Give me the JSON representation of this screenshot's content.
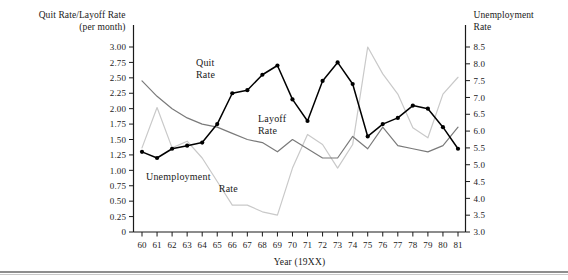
{
  "chart_data": {
    "type": "line",
    "title": "",
    "xlabel": "Year (19XX)",
    "ylabel_left": "Quit Rate/Layoff Rate\n(per month)",
    "ylabel_right": "Unemployment\nRate",
    "x": [
      60,
      61,
      62,
      63,
      64,
      65,
      66,
      67,
      68,
      69,
      70,
      71,
      72,
      73,
      74,
      75,
      76,
      77,
      78,
      79,
      80,
      81
    ],
    "xtick_labels": [
      "60",
      "61",
      "62",
      "63",
      "64",
      "65",
      "66",
      "67",
      "68",
      "69",
      "70",
      "71",
      "72",
      "73",
      "74",
      "75",
      "76",
      "77",
      "78",
      "79",
      "80",
      "81"
    ],
    "left_axis": {
      "ylim": [
        0,
        3.0
      ],
      "ticks": [
        0,
        0.25,
        0.5,
        0.75,
        1.0,
        1.25,
        1.5,
        1.75,
        2.0,
        2.25,
        2.5,
        2.75,
        3.0
      ],
      "tick_labels": [
        "0",
        "0.25",
        "0.50",
        "0.75",
        "1.00",
        "1.25",
        "1.50",
        "1.75",
        "2.00",
        "2.25",
        "2.50",
        "2.75",
        "3.00"
      ]
    },
    "right_axis": {
      "ylim": [
        3.0,
        8.5
      ],
      "ticks": [
        3.0,
        3.5,
        4.0,
        4.5,
        5.0,
        5.5,
        6.0,
        6.5,
        7.0,
        7.5,
        8.0,
        8.5
      ],
      "tick_labels": [
        "3.0",
        "3.5",
        "4.0",
        "4.5",
        "5.0",
        "5.5",
        "6.0",
        "6.5",
        "7.0",
        "7.5",
        "8.0",
        "8.5"
      ]
    },
    "grid": false,
    "legend_position": "inline-annotations",
    "series": [
      {
        "name": "Quit Rate",
        "axis": "left",
        "color": "#000000",
        "markers": true,
        "label_text": "Quit\nRate",
        "values": [
          1.3,
          1.2,
          1.35,
          1.4,
          1.45,
          1.75,
          2.25,
          2.3,
          2.55,
          2.7,
          2.15,
          1.8,
          2.45,
          2.75,
          2.4,
          1.55,
          1.75,
          1.85,
          2.05,
          2.0,
          1.7,
          1.35
        ]
      },
      {
        "name": "Layoff Rate",
        "axis": "left",
        "color": "#7a7a7a",
        "markers": false,
        "label_text": "Layoff\nRate",
        "values": [
          2.45,
          2.2,
          2.0,
          1.85,
          1.75,
          1.7,
          1.6,
          1.5,
          1.45,
          1.3,
          1.5,
          1.35,
          1.2,
          1.2,
          1.55,
          1.35,
          1.7,
          1.4,
          1.35,
          1.3,
          1.4,
          1.7
        ]
      },
      {
        "name": "Unemployment Rate",
        "axis": "right",
        "color": "#c9c9c9",
        "markers": false,
        "label_text": "Unemployment\nRate",
        "values": [
          5.5,
          6.7,
          5.5,
          5.7,
          5.2,
          4.5,
          3.8,
          3.8,
          3.6,
          3.5,
          4.9,
          5.9,
          5.6,
          4.9,
          5.6,
          8.5,
          7.7,
          7.1,
          6.1,
          5.8,
          7.1,
          7.6
        ]
      }
    ],
    "annotations": [
      {
        "name": "quit-rate-label",
        "text": "Quit\nRate",
        "x": 196,
        "y": 66
      },
      {
        "name": "layoff-rate-label",
        "text": "Layoff\nRate",
        "x": 258,
        "y": 122
      },
      {
        "name": "unemployment-rate-label",
        "text": "Unemployment\nRate",
        "x": 146,
        "y": 180
      }
    ],
    "colors": {
      "quit": "#000000",
      "layoff": "#7a7a7a",
      "unemployment": "#c9c9c9",
      "axis": "#1a1a1a",
      "rule": "#8e8e8e"
    }
  }
}
